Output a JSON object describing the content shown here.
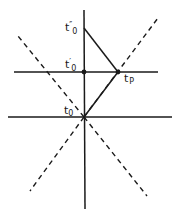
{
  "diagram": {
    "title": "",
    "colors": {
      "line": "#1a1a1a",
      "background": "#ffffff"
    },
    "labels": {
      "t0_double_prime": {
        "base": "t",
        "prime": "″",
        "sub": "0"
      },
      "t0_prime": {
        "base": "t",
        "prime": "′",
        "sub": "0"
      },
      "tp": {
        "base": "t",
        "sub": "P"
      },
      "t0": {
        "base": "t",
        "sub": "0"
      }
    },
    "points": {
      "t0_double_prime": [
        84,
        28
      ],
      "t0_prime": [
        84,
        72
      ],
      "tp": [
        118,
        72
      ],
      "t0": [
        84,
        117
      ]
    },
    "solid_lines": [
      {
        "name": "vertical-axis",
        "from": [
          84,
          10
        ],
        "to": [
          85,
          209
        ]
      },
      {
        "name": "upper-horizontal",
        "from": [
          14,
          72
        ],
        "to": [
          158,
          72
        ]
      },
      {
        "name": "lower-horizontal",
        "from": [
          8,
          117
        ],
        "to": [
          172,
          117
        ]
      },
      {
        "name": "signal-return",
        "from": [
          84,
          28
        ],
        "to": [
          118,
          72
        ]
      },
      {
        "name": "signal-emit",
        "from": [
          84,
          117
        ],
        "to": [
          118,
          72
        ]
      }
    ],
    "dashed_lines": [
      {
        "name": "light-cone-right-future",
        "from": [
          84,
          117
        ],
        "to": [
          158,
          18
        ]
      },
      {
        "name": "light-cone-left-future",
        "from": [
          84,
          117
        ],
        "to": [
          18,
          36
        ]
      },
      {
        "name": "light-cone-left-past",
        "from": [
          84,
          117
        ],
        "to": [
          30,
          191
        ]
      },
      {
        "name": "light-cone-right-past",
        "from": [
          84,
          117
        ],
        "to": [
          147,
          196
        ]
      }
    ]
  }
}
